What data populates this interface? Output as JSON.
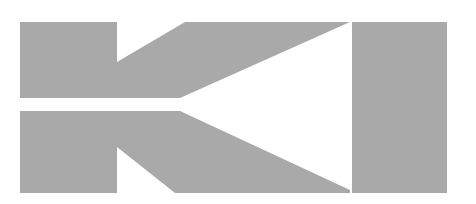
{
  "image": {
    "description": "Abstract gray geometric logo mark resembling a stylized letter K beside a vertical bar",
    "colors": {
      "shape": "#a9a9a9",
      "background": "#ffffff"
    }
  }
}
